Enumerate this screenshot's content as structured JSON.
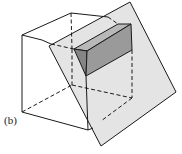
{
  "figure": {
    "label": "(b)",
    "colors": {
      "line": "#1a1a1a",
      "plane_fill": "#e4e4e4",
      "prism_front": "#9a9a9a",
      "prism_top": "#b8b8b8",
      "prism_side": "#858585",
      "background": "#ffffff"
    }
  }
}
